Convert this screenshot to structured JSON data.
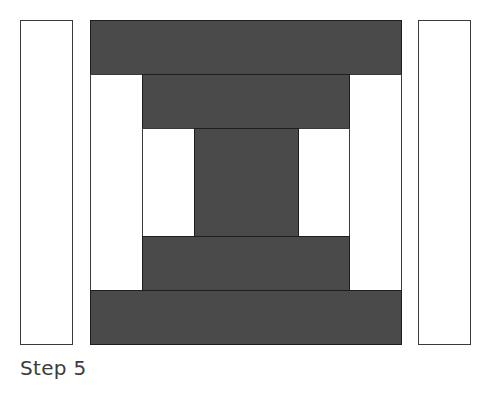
{
  "diagram": {
    "caption": "Step 5",
    "colors": {
      "dark_fabric": "#4a4a4a",
      "light_fabric": "#ffffff",
      "outline": "#1e1e1e"
    },
    "pieces": [
      {
        "name": "left-loose-strip",
        "tone": "light",
        "x": 20,
        "y": 20,
        "w": 53,
        "h": 325
      },
      {
        "name": "top-dark-strip-outer",
        "tone": "dark",
        "x": 90,
        "y": 20,
        "w": 312,
        "h": 55
      },
      {
        "name": "left-light-strip-outer",
        "tone": "light",
        "x": 90,
        "y": 74,
        "w": 53,
        "h": 217
      },
      {
        "name": "right-light-strip-outer",
        "tone": "light",
        "x": 349,
        "y": 74,
        "w": 53,
        "h": 217
      },
      {
        "name": "top-dark-strip-inner",
        "tone": "dark",
        "x": 142,
        "y": 74,
        "w": 208,
        "h": 55
      },
      {
        "name": "left-light-strip-inner",
        "tone": "light",
        "x": 142,
        "y": 128,
        "w": 53,
        "h": 109
      },
      {
        "name": "right-light-strip-inner",
        "tone": "light",
        "x": 298,
        "y": 128,
        "w": 52,
        "h": 109
      },
      {
        "name": "center-square",
        "tone": "dark",
        "x": 194,
        "y": 128,
        "w": 105,
        "h": 109
      },
      {
        "name": "bottom-dark-strip-inner",
        "tone": "dark",
        "x": 142,
        "y": 236,
        "w": 208,
        "h": 55
      },
      {
        "name": "bottom-dark-strip-outer",
        "tone": "dark",
        "x": 90,
        "y": 290,
        "w": 312,
        "h": 55
      },
      {
        "name": "right-loose-strip",
        "tone": "light",
        "x": 418,
        "y": 20,
        "w": 53,
        "h": 325
      }
    ]
  }
}
